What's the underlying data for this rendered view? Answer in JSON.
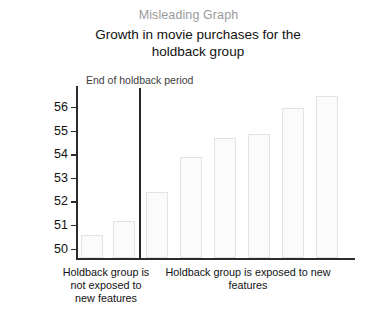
{
  "chart_data": {
    "type": "bar",
    "title": "Growth in movie purchases for the holdback group",
    "supertitle": "Misleading Graph",
    "xlabel": "",
    "ylabel": "Total Movie Purchases",
    "ylim": [
      49.6,
      56.9
    ],
    "yticks": [
      50,
      51,
      52,
      53,
      54,
      55,
      56
    ],
    "ytick_labels": [
      "50",
      "51",
      "52",
      "53",
      "54",
      "55",
      "56"
    ],
    "grid": false,
    "legend": null,
    "categories": [
      "1",
      "2",
      "3",
      "4",
      "5",
      "6",
      "7",
      "8"
    ],
    "values": [
      50.6,
      51.2,
      52.4,
      53.9,
      54.7,
      54.9,
      56.0,
      56.5
    ],
    "annotations": [
      {
        "name": "end-of-holdback-period",
        "text": "End of holdback period",
        "type": "vertical-line",
        "after_category_index": 1
      }
    ],
    "group_captions": [
      "Holdback group is not exposed to new features",
      "Holdback group is exposed to new features"
    ]
  },
  "chart": {
    "supertitle": "Misleading Graph",
    "title_line1": "Growth in movie purchases for the",
    "title_line2": "holdback group",
    "ylabel": "Total Movie Purchases",
    "divider_label": "End of holdback period",
    "caption_left_line1": "Holdback group is",
    "caption_left_line2": "not exposed to",
    "caption_left_line3": "new features",
    "caption_right_line1": "Holdback group is exposed to new",
    "caption_right_line2": "features",
    "tick_50": "50",
    "tick_51": "51",
    "tick_52": "52",
    "tick_53": "53",
    "tick_54": "54",
    "tick_55": "55",
    "tick_56": "56"
  },
  "colors": {
    "bar_fill": "#fbfbfb",
    "bar_border": "#e3e3e3",
    "axis": "#2b2b2b",
    "supertitle": "#9a9a9a",
    "text": "#111111",
    "divider": "#262626"
  }
}
